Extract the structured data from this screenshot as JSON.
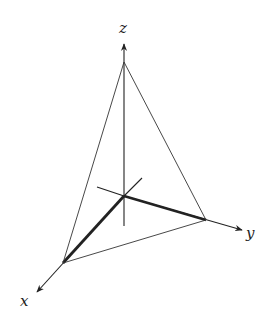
{
  "diagram": {
    "type": "3d-coordinate-axes-with-tetrahedron",
    "axes": {
      "x": {
        "label": "x"
      },
      "y": {
        "label": "y"
      },
      "z": {
        "label": "z"
      }
    },
    "colors": {
      "stroke": "#222222",
      "background": "#ffffff"
    },
    "points": {
      "origin": [
        124,
        196
      ],
      "x_vertex": [
        63,
        263
      ],
      "y_vertex": [
        206,
        220
      ],
      "z_vertex": [
        124,
        62
      ]
    }
  }
}
